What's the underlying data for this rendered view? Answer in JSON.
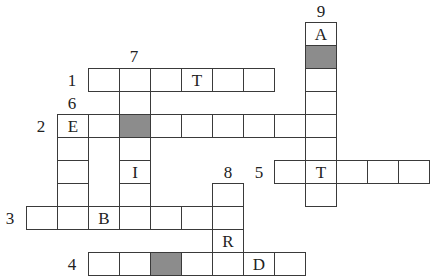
{
  "puzzle": {
    "type": "crossword",
    "colors": {
      "line": "#3a3a3a",
      "shaded": "#8c8c8c",
      "background": "#ffffff"
    },
    "clue_numbers": [
      {
        "label": "1",
        "x": 72,
        "y": 80
      },
      {
        "label": "2",
        "x": 41,
        "y": 126
      },
      {
        "label": "3",
        "x": 10,
        "y": 218
      },
      {
        "label": "4",
        "x": 72,
        "y": 264
      },
      {
        "label": "5",
        "x": 259,
        "y": 172
      },
      {
        "label": "6",
        "x": 72,
        "y": 103
      },
      {
        "label": "7",
        "x": 134,
        "y": 56
      },
      {
        "label": "8",
        "x": 228,
        "y": 172
      },
      {
        "label": "9",
        "x": 321,
        "y": 11
      }
    ],
    "words": {
      "1": {
        "direction": "across",
        "start_col": 2,
        "row": 2,
        "length": 6,
        "letters": {
          "3": "T"
        },
        "shaded": []
      },
      "2": {
        "direction": "across",
        "start_col": 1,
        "row": 4,
        "length": 9,
        "letters": {
          "0": "E"
        },
        "shaded": [
          2
        ]
      },
      "3": {
        "direction": "across",
        "start_col": 0,
        "row": 8,
        "length": 7,
        "letters": {
          "2": "B"
        },
        "shaded": []
      },
      "4": {
        "direction": "across",
        "start_col": 2,
        "row": 10,
        "length": 7,
        "letters": {
          "5": "D"
        },
        "shaded": [
          2
        ]
      },
      "5": {
        "direction": "across",
        "start_col": 8,
        "row": 6,
        "length": 5,
        "letters": {
          "1": "T"
        },
        "shaded": []
      },
      "6": {
        "direction": "down",
        "col": 1,
        "start_row": 4,
        "length": 5,
        "letters": {
          "0": "E"
        },
        "shaded": []
      },
      "7": {
        "direction": "down",
        "col": 3,
        "start_row": 2,
        "length": 7,
        "letters": {
          "4": "I"
        },
        "shaded": [
          2
        ]
      },
      "8": {
        "direction": "down",
        "col": 6,
        "start_row": 7,
        "length": 4,
        "letters": {
          "2": "R"
        },
        "shaded": []
      },
      "9": {
        "direction": "down",
        "col": 9,
        "start_row": 0,
        "length": 8,
        "letters": {
          "0": "A",
          "6": "T"
        },
        "shaded": [
          1
        ]
      }
    },
    "grid_origin": {
      "x": 26,
      "y": 22
    },
    "cell_size": {
      "w": 31,
      "h": 23
    }
  }
}
